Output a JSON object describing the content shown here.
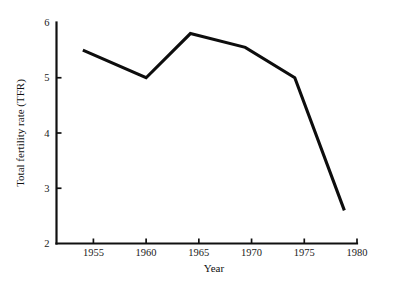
{
  "chart_data": {
    "type": "line",
    "title": "",
    "xlabel": "Year",
    "ylabel": "Total fertility rate (TFR)",
    "xlim": [
      1951.5,
      1980
    ],
    "ylim": [
      2,
      6
    ],
    "xticks": [
      1955,
      1960,
      1965,
      1970,
      1975,
      1980
    ],
    "xtick_labels": [
      "1955",
      "1960",
      "1965",
      "1970",
      "1975",
      "1980"
    ],
    "yticks": [
      2,
      3,
      4,
      5,
      6
    ],
    "ytick_labels": [
      "2",
      "3",
      "4",
      "5",
      "6"
    ],
    "grid": false,
    "legend": false,
    "line_color": "#0d0d0d",
    "background_color": "#ffffff",
    "series": [
      {
        "name": "Total fertility rate (TFR)",
        "x": [
          1954.0,
          1960.0,
          1964.2,
          1969.4,
          1974.1,
          1978.8
        ],
        "values": [
          5.5,
          5.0,
          5.8,
          5.55,
          5.0,
          2.6
        ]
      }
    ]
  }
}
